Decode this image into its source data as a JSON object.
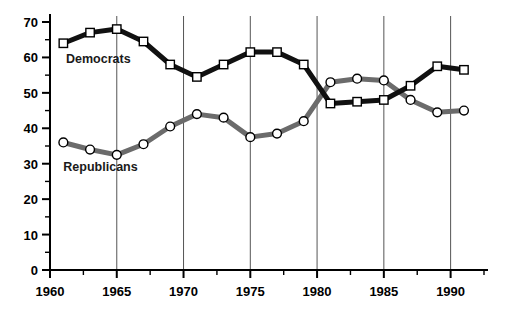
{
  "chart_data": {
    "type": "line",
    "title": "",
    "xlabel": "",
    "ylabel": "",
    "xlim": [
      1960,
      1992.5
    ],
    "ylim": [
      0,
      70
    ],
    "ytick_values": [
      0,
      10,
      20,
      30,
      40,
      50,
      60,
      70
    ],
    "ytick_labels": [
      "0",
      "10",
      "20",
      "30",
      "40",
      "50",
      "60",
      "70"
    ],
    "yminor_step": 5,
    "xtick_values": [
      1960,
      1965,
      1970,
      1975,
      1980,
      1985,
      1990
    ],
    "xtick_labels": [
      "1960",
      "1965",
      "1970",
      "1975",
      "1980",
      "1985",
      "1990"
    ],
    "xminor_step": 2.5,
    "gridlines": {
      "vertical_at": [
        1965,
        1970,
        1975,
        1980,
        1985,
        1990
      ],
      "horizontal": false,
      "color": "#555555"
    },
    "legend_position": "inline-annotation",
    "series": [
      {
        "name": "Democrats",
        "color": "#111111",
        "marker": "square",
        "marker_fill": "#ffffff",
        "label_x": 1961.2,
        "label_y": 58.5,
        "x": [
          1961,
          1963,
          1965,
          1967,
          1969,
          1971,
          1973,
          1975,
          1977,
          1979,
          1981,
          1983,
          1985,
          1987,
          1989,
          1991
        ],
        "values": [
          64,
          67,
          68,
          64.5,
          58,
          54.5,
          58,
          61.5,
          61.5,
          58,
          47,
          47.5,
          48,
          52,
          57.5,
          56.5
        ]
      },
      {
        "name": "Republicans",
        "color": "#6b6b6b",
        "marker": "circle",
        "marker_fill": "#ffffff",
        "label_x": 1961.0,
        "label_y": 28.0,
        "x": [
          1961,
          1963,
          1965,
          1967,
          1969,
          1971,
          1973,
          1975,
          1977,
          1979,
          1981,
          1983,
          1985,
          1987,
          1989,
          1991
        ],
        "values": [
          36,
          34,
          32.5,
          35.5,
          40.5,
          44,
          43,
          37.5,
          38.5,
          42,
          53,
          54,
          53.5,
          48,
          44.5,
          45
        ]
      }
    ]
  },
  "axes": {
    "y_axis_name": "percent-axis",
    "x_axis_name": "year-axis"
  }
}
